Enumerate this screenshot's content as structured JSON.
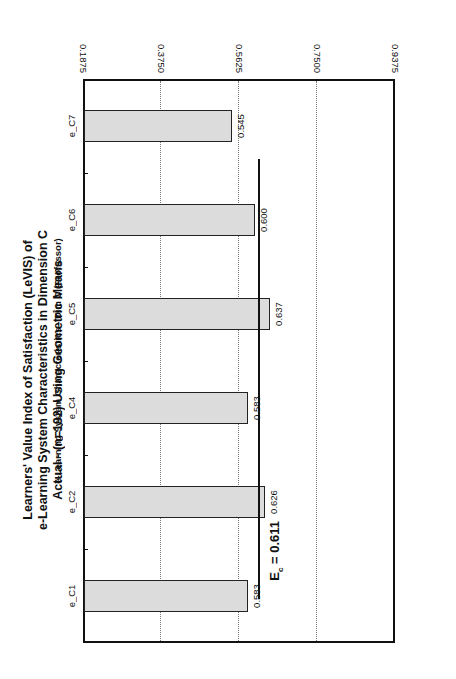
{
  "chart_data": {
    "type": "bar",
    "orientation": "vertical bars; figure rotated 90 degrees on the page",
    "title": "Learners' Value Index of Satisfaction (LeVIS) of e-Learning System Characteristics in Dimension C Actual - (n=192) Using Geometric Means",
    "title_lines": [
      "Learners' Value Index of Satisfaction (LeVIS) of",
      "e-Learning System Characteristics in Dimension C",
      "Actual - (n=192) Using Geometric Means"
    ],
    "xlabel": "e-Learning System Characteristics - Dim C (Professor)",
    "ylabel": "LeVIS",
    "categories": [
      "e_C1",
      "e_C2",
      "e_C4",
      "e_C5",
      "e_C6",
      "e_C7"
    ],
    "values": [
      0.583,
      0.626,
      0.583,
      0.637,
      0.6,
      0.545
    ],
    "value_labels": [
      "0.583",
      "0.626",
      "0.583",
      "0.637",
      "0.600",
      "0.545"
    ],
    "ylim": [
      0.1875,
      0.9375
    ],
    "yticks": [
      0.1875,
      0.375,
      0.5625,
      0.75,
      0.9375
    ],
    "ytick_labels": [
      "0.1875",
      "0.3750",
      "0.5625",
      "0.7500",
      "0.9375"
    ],
    "grid": "horizontal dotted at y ticks",
    "reference_line": {
      "label_main": "E",
      "label_sub": "c",
      "label_value": " = 0.611",
      "value": 0.611
    },
    "bar_color": "#dcdcdc",
    "legend": "none"
  }
}
